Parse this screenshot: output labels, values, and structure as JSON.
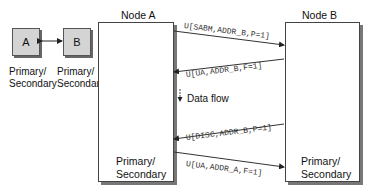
{
  "left_pair": {
    "box_a": {
      "label": "A",
      "role_line1": "Primary/",
      "role_line2": "Secondary"
    },
    "box_b": {
      "label": "B",
      "role_line1": "Primary/",
      "role_line2": "Secondary"
    }
  },
  "node_a": {
    "title": "Node A",
    "role_line1": "Primary/",
    "role_line2": "Secondary"
  },
  "node_b": {
    "title": "Node B",
    "role_line1": "Primary/",
    "role_line2": "Secondary"
  },
  "messages": [
    {
      "text": "U[SABM,ADDR_B,P=1]",
      "direction": "A-to-B"
    },
    {
      "text": "U[UA,ADDR_B,F=1]",
      "direction": "B-to-A"
    },
    {
      "text": "U[DISC,ADDR_B,P=1]",
      "direction": "B-to-A"
    },
    {
      "text": "U[UA,ADDR_A,F=1]",
      "direction": "A-to-B"
    }
  ],
  "legend": {
    "data_flow": "Data flow"
  },
  "colors": {
    "box_fill": "#d4d4d4",
    "shadow": "#777777",
    "line": "#333333"
  }
}
